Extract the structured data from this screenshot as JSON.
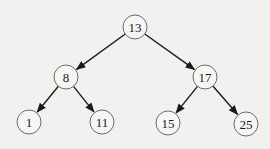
{
  "diagram": {
    "type": "binary-search-tree",
    "colors": {
      "background": "#f1f1ef",
      "node_fill": "#f6f6f4",
      "node_stroke": "#6a6a6a",
      "edge": "#1a1a1a",
      "text": "#1a1a1a"
    },
    "node_radius": 12,
    "nodes": [
      {
        "id": "n13",
        "label": "13",
        "x": 135,
        "y": 27
      },
      {
        "id": "n8",
        "label": "8",
        "x": 66,
        "y": 77
      },
      {
        "id": "n17",
        "label": "17",
        "x": 205,
        "y": 77
      },
      {
        "id": "n1",
        "label": "1",
        "x": 29,
        "y": 122
      },
      {
        "id": "n11",
        "label": "11",
        "x": 102,
        "y": 122
      },
      {
        "id": "n15",
        "label": "15",
        "x": 168,
        "y": 123
      },
      {
        "id": "n25",
        "label": "25",
        "x": 246,
        "y": 124
      }
    ],
    "edges": [
      {
        "from": "n13",
        "to": "n8"
      },
      {
        "from": "n13",
        "to": "n17"
      },
      {
        "from": "n8",
        "to": "n1"
      },
      {
        "from": "n8",
        "to": "n11"
      },
      {
        "from": "n17",
        "to": "n15"
      },
      {
        "from": "n17",
        "to": "n25"
      }
    ]
  }
}
